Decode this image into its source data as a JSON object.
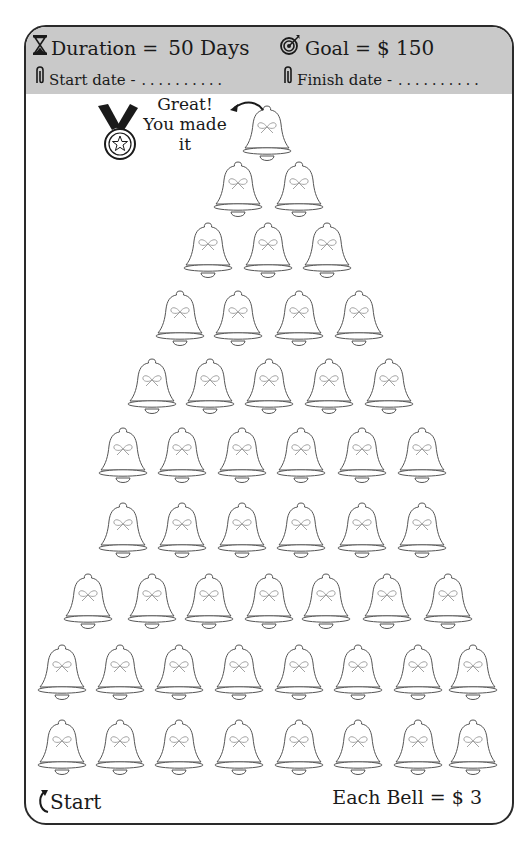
{
  "header": {
    "duration_label": "Duration =",
    "duration_value": "50 Days",
    "goal_label": "Goal =",
    "goal_value": "$ 150",
    "start_date_label": "Start date -",
    "start_date_value": "..........",
    "finish_date_label": "Finish date -",
    "finish_date_value": ".........."
  },
  "icons": {
    "duration": "hourglass-icon",
    "goal": "target-icon",
    "start_date": "paperclip-icon",
    "finish_date": "paperclip-icon",
    "medal": "medal-icon",
    "bell": "bell-icon"
  },
  "finish_message": {
    "line1": "Great!",
    "line2": "You made",
    "line3": "it"
  },
  "footer": {
    "start_label": "Start",
    "each_bell_label": "Each Bell = $ 3"
  },
  "tracker": {
    "total_bells": 50,
    "value_per_bell": 3,
    "rows": [
      {
        "y": 102,
        "x": [
          267
        ]
      },
      {
        "y": 158,
        "x": [
          238,
          299
        ]
      },
      {
        "y": 219,
        "x": [
          208,
          268,
          327
        ]
      },
      {
        "y": 287,
        "x": [
          180,
          238,
          299,
          359
        ]
      },
      {
        "y": 355,
        "x": [
          152,
          210,
          269,
          329,
          389
        ]
      },
      {
        "y": 424,
        "x": [
          123,
          182,
          242,
          301,
          362,
          422
        ]
      },
      {
        "y": 499,
        "x": [
          123,
          182,
          242,
          301,
          362,
          422
        ]
      },
      {
        "y": 570,
        "x": [
          88,
          152,
          209,
          269,
          326,
          387,
          448
        ]
      },
      {
        "y": 641,
        "x": [
          62,
          120,
          179,
          239,
          299,
          358,
          418,
          473
        ]
      },
      {
        "y": 716,
        "x": [
          62,
          120,
          179,
          239,
          299,
          358,
          418,
          473
        ]
      }
    ]
  },
  "colors": {
    "header_bg": "#c9c9c9",
    "ink": "#1a1a1a",
    "bell_stroke": "#555555",
    "bow": "#9a9a9a"
  }
}
